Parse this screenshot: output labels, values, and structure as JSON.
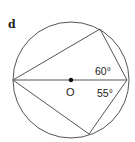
{
  "figure": {
    "part_label": "d",
    "center_label": "O",
    "angles": [
      {
        "value": "60°",
        "position": "upper-right, between diameter and top chord"
      },
      {
        "value": "55°",
        "position": "lower-right, between diameter and bottom chord"
      }
    ],
    "colors": {
      "stroke": "#555555",
      "text": "#222222",
      "background": "#ffffff"
    }
  },
  "geometry": {
    "circle": {
      "cx": 71,
      "cy": 80,
      "r": 58
    },
    "diameter_left": [
      13,
      80
    ],
    "diameter_right": [
      127,
      80
    ],
    "top_vertex": [
      100,
      29
    ],
    "bottom_vertex": [
      89,
      134
    ]
  }
}
